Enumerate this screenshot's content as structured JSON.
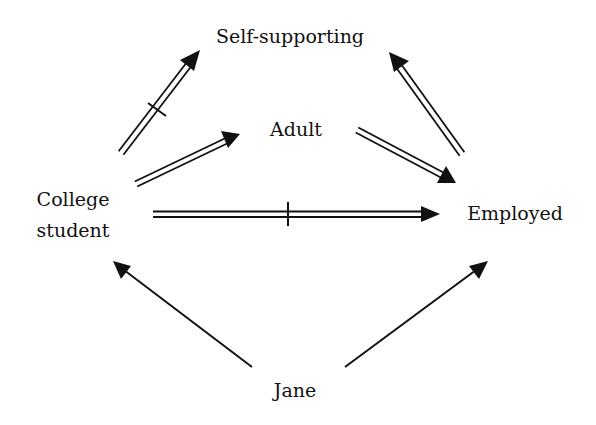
{
  "diagram": {
    "title": "",
    "colors": {
      "ink": "#111111",
      "background": "#ffffff"
    },
    "nodes": {
      "self_supporting": {
        "label": "Self-supporting",
        "x": 290,
        "y": 42
      },
      "adult": {
        "label": "Adult",
        "x": 296,
        "y": 134
      },
      "college_student": {
        "label_line1": "College",
        "label_line2": "student",
        "x": 73,
        "y1": 205,
        "y2": 236
      },
      "employed": {
        "label": "Employed",
        "x": 515,
        "y": 219
      },
      "jane": {
        "label": "Jane",
        "x": 295,
        "y": 396
      }
    },
    "edges": [
      {
        "from": "College student",
        "to": "Self-supporting",
        "style": "double",
        "negated": true
      },
      {
        "from": "College student",
        "to": "Adult",
        "style": "double",
        "negated": false
      },
      {
        "from": "Adult",
        "to": "Employed",
        "style": "double",
        "negated": false
      },
      {
        "from": "Employed",
        "to": "Self-supporting",
        "style": "double",
        "negated": false
      },
      {
        "from": "College student",
        "to": "Employed",
        "style": "double",
        "negated": true
      },
      {
        "from": "Jane",
        "to": "College student",
        "style": "single",
        "negated": false
      },
      {
        "from": "Jane",
        "to": "Employed",
        "style": "single",
        "negated": false
      }
    ]
  }
}
